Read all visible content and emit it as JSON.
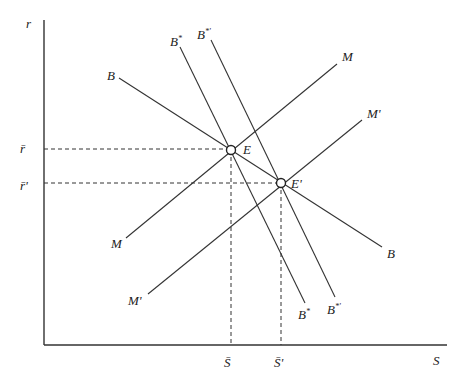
{
  "diagram": {
    "axes": {
      "x_label": "S",
      "y_label": "r",
      "origin": [
        44,
        345
      ],
      "x_end": [
        447,
        345
      ],
      "y_end": [
        44,
        20
      ]
    },
    "curves": [
      {
        "name": "B",
        "start_label": "B",
        "end_label": "B",
        "from": [
          119,
          78
        ],
        "to": [
          382,
          247
        ]
      },
      {
        "name": "B*",
        "start_label": "B*",
        "end_label": "B*",
        "from": [
          180,
          47
        ],
        "to": [
          305,
          303
        ]
      },
      {
        "name": "B*'",
        "start_label": "B*'",
        "end_label": "B*'",
        "from": [
          211,
          40
        ],
        "to": [
          335,
          297
        ]
      },
      {
        "name": "M",
        "start_label": "M",
        "end_label": "M",
        "from": [
          126,
          238
        ],
        "to": [
          337,
          64
        ]
      },
      {
        "name": "M'",
        "start_label": "M'",
        "end_label": "M'",
        "from": [
          148,
          294
        ],
        "to": [
          362,
          120
        ]
      }
    ],
    "equilibria": [
      {
        "label": "E",
        "point": [
          231,
          150
        ],
        "r_label": "r̄",
        "s_label": "S̄"
      },
      {
        "label": "E'",
        "point": [
          281,
          183
        ],
        "r_label": "r̄'",
        "s_label": "S̄'"
      }
    ]
  }
}
